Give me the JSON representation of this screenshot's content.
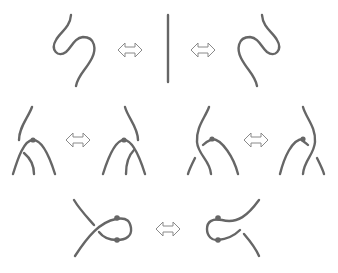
{
  "diagram": {
    "colors": {
      "strand": "#666666",
      "node": "#666666",
      "arrow_outline": "#8a8a8a",
      "background": "#ffffff"
    },
    "rows": [
      {
        "id": "move-I-zigzag",
        "description": "Zigzag cancellation: left zigzag, straight strand, right zigzag",
        "panels": [
          "left-zigzag",
          "straight-strand",
          "right-zigzag"
        ],
        "equivalences": 2
      },
      {
        "id": "move-II-cusp-passing",
        "description": "Strand passing over/under a cusp with marked point (two variants)",
        "pairs": [
          {
            "before": "cusp-with-left-strand",
            "after": "cusp-with-right-strand"
          },
          {
            "before": "cusp-with-crossing-strand-left",
            "after": "cusp-with-crossing-strand-right"
          }
        ]
      },
      {
        "id": "move-III-loop",
        "description": "Kink loop with two marked cusp points flipped",
        "pairs": [
          {
            "before": "loop-right",
            "after": "loop-left"
          }
        ]
      }
    ],
    "icons": {
      "equivalence": "double-headed-arrow-icon"
    }
  }
}
